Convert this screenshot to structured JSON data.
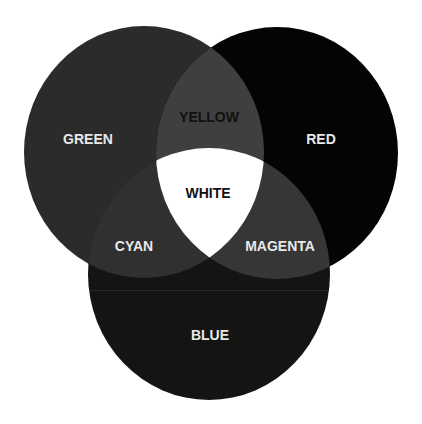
{
  "diagram": {
    "type": "venn",
    "background": "#ffffff",
    "circles": [
      {
        "label": "GREEN",
        "color": "#2b2b2b",
        "label_color": "#e8e8e8"
      },
      {
        "label": "RED",
        "color": "#040404",
        "label_color": "#e8e8e8"
      },
      {
        "label": "BLUE",
        "color": "#141414",
        "label_color": "#e8e8e8"
      }
    ],
    "intersections": [
      {
        "label": "YELLOW",
        "sets": [
          "GREEN",
          "RED"
        ],
        "color": "#3f3f3f",
        "label_color": "#111111"
      },
      {
        "label": "CYAN",
        "sets": [
          "GREEN",
          "BLUE"
        ],
        "color": "#303030",
        "label_color": "#e8e8e8"
      },
      {
        "label": "MAGENTA",
        "sets": [
          "RED",
          "BLUE"
        ],
        "color": "#363636",
        "label_color": "#e8e8e8"
      },
      {
        "label": "WHITE",
        "sets": [
          "GREEN",
          "RED",
          "BLUE"
        ],
        "color": "#ffffff",
        "label_color": "#111111"
      }
    ],
    "seam_color": "#2a2a2a"
  }
}
